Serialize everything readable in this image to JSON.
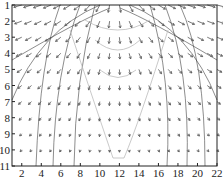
{
  "chart_data": {
    "type": "quiver",
    "title": "",
    "xlabel": "",
    "ylabel": "",
    "xlim": [
      1,
      22
    ],
    "ylim": [
      11,
      1
    ],
    "y_reversed": true,
    "x_ticks": [
      "2",
      "4",
      "6",
      "8",
      "10",
      "12",
      "14",
      "16",
      "18",
      "20",
      "22"
    ],
    "y_ticks": [
      "1",
      "2",
      "3",
      "4",
      "5",
      "6",
      "7",
      "8",
      "9",
      "10",
      "11"
    ],
    "grid": false,
    "legend": null,
    "contours": {
      "dark_lines": "curved field lines emanating from top-center and bending to vertical near x≈2.7, 4.5, 6.6 (left) and x≈16.3, 18.4, 20.3 (right)",
      "light_lines": "V-shaped light gray contour converging to bottom at x≈11-12; arcs near top center"
    }
  },
  "colors": {
    "arrow": "#555555",
    "dark_contour": "#333333",
    "light_contour": "#bbbbbb",
    "axis": "#222222"
  }
}
